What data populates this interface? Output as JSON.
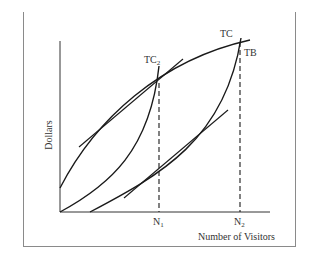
{
  "diagram": {
    "y_axis_label": "Dollars",
    "x_axis_label": "Number of Visitors",
    "curve_labels": {
      "tc": "TC",
      "tb": "TB",
      "tc2_main": "TC",
      "tc2_sub": "2"
    },
    "x_ticks": [
      {
        "main": "N",
        "sub": "1"
      },
      {
        "main": "N",
        "sub": "2"
      }
    ],
    "colors": {
      "curve": "#1a1a1a",
      "frame": "#8a8a8a",
      "text": "#333333"
    }
  }
}
